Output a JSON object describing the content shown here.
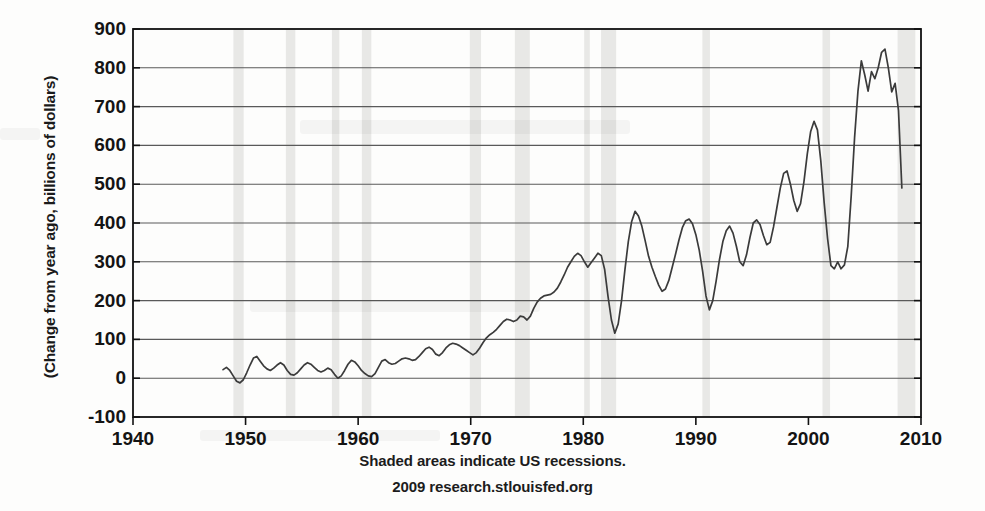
{
  "chart_data": {
    "type": "line",
    "title": "",
    "subtitle": "",
    "xlabel": "",
    "ylabel": "(Change from year ago, billions of dollars)",
    "xlim": [
      1940,
      2010
    ],
    "ylim": [
      -100,
      900
    ],
    "xticks": [
      1940,
      1950,
      1960,
      1970,
      1980,
      1990,
      2000,
      2010
    ],
    "yticks": [
      -100,
      0,
      100,
      200,
      300,
      400,
      500,
      600,
      700,
      800,
      900
    ],
    "grid": true,
    "legend_position": "none",
    "line_color": "#3b3b3b",
    "recession_band_color": "#e8e8e6",
    "axis_color": "#111111",
    "gridline_color": "#5a5a5a",
    "annotations": [
      "Shaded areas indicate US recessions.",
      "2009 research.stlouisfed.org"
    ],
    "recessions": [
      {
        "start": 1948.92,
        "end": 1949.83
      },
      {
        "start": 1953.58,
        "end": 1954.42
      },
      {
        "start": 1957.67,
        "end": 1958.33
      },
      {
        "start": 1960.33,
        "end": 1961.17
      },
      {
        "start": 1969.92,
        "end": 1970.92
      },
      {
        "start": 1973.92,
        "end": 1975.25
      },
      {
        "start": 1980.08,
        "end": 1980.58
      },
      {
        "start": 1981.58,
        "end": 1982.92
      },
      {
        "start": 1990.58,
        "end": 1991.25
      },
      {
        "start": 2001.25,
        "end": 2001.92
      },
      {
        "start": 2007.92,
        "end": 2009.5
      }
    ],
    "series": [
      {
        "name": "Change from year ago",
        "x": [
          1948.0,
          1948.3,
          1948.6,
          1948.9,
          1949.2,
          1949.5,
          1949.8,
          1950.1,
          1950.4,
          1950.7,
          1951.0,
          1951.3,
          1951.6,
          1951.9,
          1952.2,
          1952.5,
          1952.8,
          1953.1,
          1953.4,
          1953.7,
          1954.0,
          1954.3,
          1954.6,
          1954.9,
          1955.2,
          1955.5,
          1955.8,
          1956.1,
          1956.4,
          1956.7,
          1957.0,
          1957.3,
          1957.6,
          1957.9,
          1958.2,
          1958.5,
          1958.8,
          1959.1,
          1959.4,
          1959.7,
          1960.0,
          1960.3,
          1960.6,
          1960.9,
          1961.2,
          1961.5,
          1961.8,
          1962.1,
          1962.4,
          1962.7,
          1963.0,
          1963.3,
          1963.6,
          1963.9,
          1964.2,
          1964.5,
          1964.8,
          1965.1,
          1965.4,
          1965.7,
          1966.0,
          1966.3,
          1966.6,
          1966.9,
          1967.2,
          1967.5,
          1967.8,
          1968.1,
          1968.4,
          1968.7,
          1969.0,
          1969.3,
          1969.6,
          1969.9,
          1970.2,
          1970.5,
          1970.8,
          1971.1,
          1971.4,
          1971.7,
          1972.0,
          1972.3,
          1972.6,
          1972.9,
          1973.2,
          1973.5,
          1973.8,
          1974.1,
          1974.4,
          1974.7,
          1975.0,
          1975.3,
          1975.6,
          1975.9,
          1976.2,
          1976.5,
          1976.8,
          1977.1,
          1977.4,
          1977.7,
          1978.0,
          1978.3,
          1978.6,
          1978.9,
          1979.2,
          1979.5,
          1979.8,
          1980.1,
          1980.4,
          1980.7,
          1981.0,
          1981.3,
          1981.6,
          1981.9,
          1982.2,
          1982.5,
          1982.8,
          1983.1,
          1983.4,
          1983.7,
          1984.0,
          1984.3,
          1984.6,
          1984.9,
          1985.2,
          1985.5,
          1985.8,
          1986.1,
          1986.4,
          1986.7,
          1987.0,
          1987.3,
          1987.6,
          1987.9,
          1988.2,
          1988.5,
          1988.8,
          1989.1,
          1989.4,
          1989.7,
          1990.0,
          1990.3,
          1990.6,
          1990.9,
          1991.2,
          1991.5,
          1991.8,
          1992.1,
          1992.4,
          1992.7,
          1993.0,
          1993.3,
          1993.6,
          1993.9,
          1994.2,
          1994.5,
          1994.8,
          1995.1,
          1995.4,
          1995.7,
          1996.0,
          1996.3,
          1996.6,
          1996.9,
          1997.2,
          1997.5,
          1997.8,
          1998.1,
          1998.4,
          1998.7,
          1999.0,
          1999.3,
          1999.6,
          1999.9,
          2000.2,
          2000.5,
          2000.8,
          2001.1,
          2001.4,
          2001.7,
          2002.0,
          2002.3,
          2002.6,
          2002.9,
          2003.2,
          2003.5,
          2003.8,
          2004.1,
          2004.4,
          2004.7,
          2005.0,
          2005.3,
          2005.6,
          2005.9,
          2006.2,
          2006.5,
          2006.8,
          2007.1,
          2007.4,
          2007.7,
          2008.0,
          2008.3
        ],
        "y": [
          22,
          28,
          20,
          6,
          -8,
          -12,
          -4,
          14,
          34,
          52,
          56,
          44,
          32,
          24,
          20,
          26,
          34,
          40,
          34,
          20,
          10,
          8,
          14,
          24,
          34,
          40,
          36,
          28,
          20,
          16,
          20,
          26,
          22,
          10,
          0,
          6,
          20,
          36,
          46,
          42,
          32,
          20,
          12,
          6,
          4,
          12,
          28,
          44,
          48,
          40,
          36,
          38,
          44,
          50,
          52,
          50,
          46,
          48,
          56,
          66,
          76,
          80,
          74,
          62,
          58,
          66,
          78,
          86,
          90,
          88,
          84,
          78,
          72,
          66,
          60,
          66,
          78,
          92,
          104,
          112,
          118,
          126,
          136,
          146,
          152,
          150,
          146,
          150,
          160,
          158,
          150,
          160,
          180,
          196,
          206,
          212,
          214,
          216,
          222,
          232,
          248,
          266,
          286,
          300,
          314,
          322,
          316,
          300,
          286,
          298,
          310,
          322,
          316,
          280,
          210,
          150,
          116,
          140,
          200,
          280,
          352,
          404,
          430,
          418,
          392,
          354,
          314,
          286,
          262,
          240,
          224,
          230,
          252,
          286,
          320,
          356,
          388,
          406,
          410,
          398,
          370,
          330,
          276,
          212,
          176,
          200,
          250,
          306,
          352,
          380,
          392,
          374,
          340,
          300,
          290,
          318,
          362,
          400,
          408,
          396,
          368,
          344,
          350,
          390,
          440,
          490,
          528,
          534,
          500,
          458,
          430,
          450,
          506,
          578,
          636,
          662,
          640,
          560,
          452,
          360,
          290,
          282,
          300,
          282,
          292,
          340,
          470,
          620,
          740,
          818,
          782,
          740,
          790,
          772,
          800,
          840,
          848,
          800,
          738,
          760,
          690,
          490
        ]
      }
    ]
  },
  "axis": {
    "ytick_labels": [
      "900",
      "800",
      "700",
      "600",
      "500",
      "400",
      "300",
      "200",
      "100",
      "0",
      "-100"
    ],
    "xtick_labels": [
      "1940",
      "1950",
      "1960",
      "1970",
      "1980",
      "1990",
      "2000",
      "2010"
    ]
  },
  "captions": {
    "recessions_note": "Shaded areas indicate US recessions.",
    "source": "2009 research.stlouisfed.org"
  }
}
